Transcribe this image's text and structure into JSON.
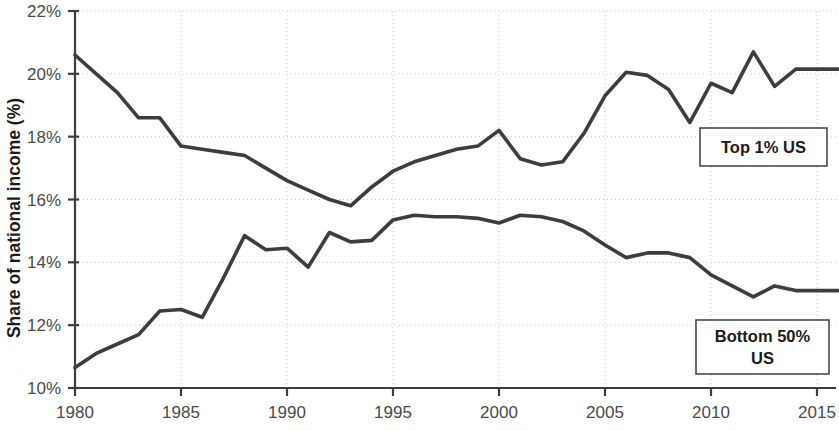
{
  "chart_data": {
    "type": "line",
    "title": "",
    "xlabel": "",
    "ylabel": "Share of national income (%)",
    "xlim": [
      1980,
      2016
    ],
    "ylim": [
      10,
      22
    ],
    "ytick_labels": [
      "22%",
      "20%",
      "18%",
      "16%",
      "14%",
      "12%",
      "10%"
    ],
    "ytick_values": [
      22,
      20,
      18,
      16,
      14,
      12,
      10
    ],
    "xtick_labels": [
      "1980",
      "1985",
      "1990",
      "1995",
      "2000",
      "2005",
      "2010",
      "2015"
    ],
    "xtick_values": [
      1980,
      1985,
      1990,
      1995,
      2000,
      2005,
      2010,
      2015
    ],
    "grid": true,
    "legend_position": "inline-labels",
    "x": [
      1980,
      1981,
      1982,
      1983,
      1984,
      1985,
      1986,
      1987,
      1988,
      1989,
      1990,
      1991,
      1992,
      1993,
      1994,
      1995,
      1996,
      1997,
      1998,
      1999,
      2000,
      2001,
      2002,
      2003,
      2004,
      2005,
      2006,
      2007,
      2008,
      2009,
      2010,
      2011,
      2012,
      2013,
      2014,
      2015,
      2016
    ],
    "series": [
      {
        "name": "Top 1% US",
        "values": [
          20.6,
          20.0,
          19.4,
          18.6,
          18.6,
          17.7,
          17.6,
          17.5,
          17.4,
          17.0,
          16.6,
          16.3,
          16.0,
          15.8,
          16.4,
          16.9,
          17.2,
          17.4,
          17.6,
          17.7,
          18.2,
          17.3,
          17.1,
          17.2,
          18.1,
          19.3,
          20.05,
          19.95,
          19.5,
          18.45,
          19.7,
          19.4,
          20.7,
          19.6,
          20.15,
          20.15,
          20.15
        ]
      },
      {
        "name": "Bottom 50% US",
        "values": [
          10.65,
          11.1,
          11.4,
          11.7,
          12.45,
          12.5,
          12.25,
          13.5,
          14.85,
          14.4,
          14.45,
          13.85,
          14.95,
          14.65,
          14.7,
          15.35,
          15.5,
          15.45,
          15.45,
          15.4,
          15.25,
          15.5,
          15.45,
          15.3,
          15.0,
          14.55,
          14.15,
          14.3,
          14.3,
          14.15,
          13.6,
          13.25,
          12.9,
          13.25,
          13.1,
          13.1,
          13.1
        ]
      }
    ],
    "annotations": [
      {
        "id": "top-label",
        "text": "Top 1% US",
        "lines": [
          "Top 1% US"
        ]
      },
      {
        "id": "bottom-label",
        "text": "Bottom 50% US",
        "lines": [
          "Bottom 50%",
          "US"
        ]
      }
    ]
  }
}
